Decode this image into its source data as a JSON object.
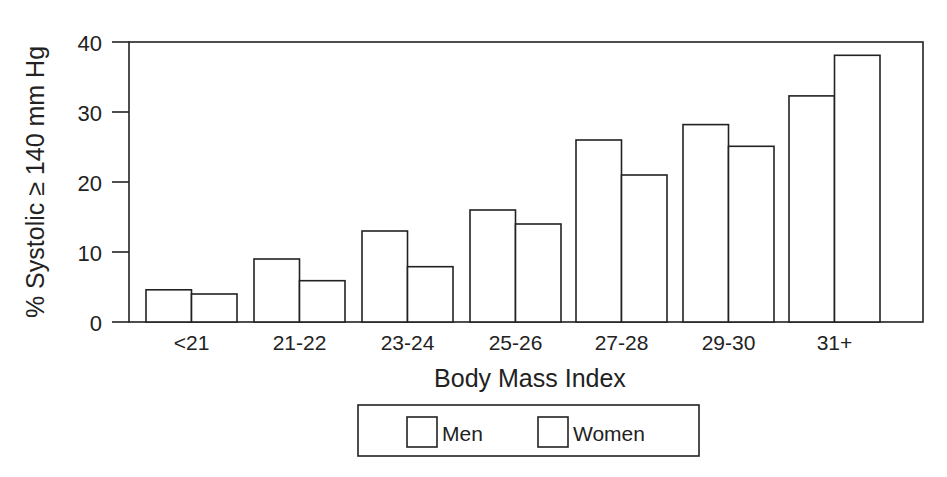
{
  "chart_data": {
    "type": "bar",
    "title": "",
    "xlabel": "Body Mass Index",
    "ylabel": "% Systolic ≥ 140 mm Hg",
    "categories": [
      "<21",
      "21-22",
      "23-24",
      "25-26",
      "27-28",
      "29-30",
      "31+"
    ],
    "series": [
      {
        "name": "Men",
        "values": [
          4.6,
          9.0,
          13.0,
          16.0,
          26.0,
          28.2,
          32.3
        ],
        "fill": "#ffffff"
      },
      {
        "name": "Women",
        "values": [
          4.0,
          5.9,
          7.9,
          14.0,
          21.0,
          25.1,
          38.1
        ],
        "fill": "#ffffff"
      }
    ],
    "ylim": [
      0,
      40
    ],
    "yticks": [
      0,
      10,
      20,
      30,
      40
    ],
    "grid": false,
    "legend_position": "bottom-center",
    "stroke_color": "#222222",
    "background": "#ffffff"
  },
  "legend": {
    "items": [
      {
        "label": "Men"
      },
      {
        "label": "Women"
      }
    ]
  }
}
